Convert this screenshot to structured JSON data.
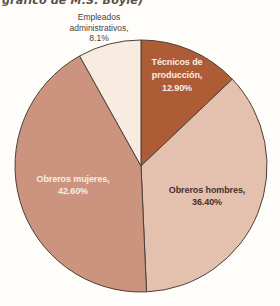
{
  "page": {
    "background": "#fefdfa",
    "caption_fragment": "gráfico de M.S. Boyle)",
    "caption_color": "#57504a"
  },
  "chart_data": {
    "type": "pie",
    "title": "",
    "legend": "none",
    "direction": "clockwise",
    "start_angle_deg": 0,
    "center": {
      "x": 141,
      "y": 166
    },
    "radius": 126,
    "outline_color": "#4a413c",
    "slices": [
      {
        "id": "tecnicos-de-produccion",
        "label": "Técnicos de producción",
        "value": 12.9,
        "display": "Técnicos de producción, 12.90%",
        "lines": [
          "Técnicos de",
          "producción,",
          "12.90%"
        ],
        "color": "#ae5c36",
        "text_color": "#f8eee3",
        "label_inside": true
      },
      {
        "id": "obreros-hombres",
        "label": "Obreros hombres",
        "value": 36.4,
        "display": "Obreros hombres, 36.40%",
        "lines": [
          "Obreros hombres,",
          "36.40%"
        ],
        "color": "#e4c0ae",
        "text_color": "#45322a",
        "label_inside": true
      },
      {
        "id": "obreros-mujeres",
        "label": "Obreros mujeres",
        "value": 42.6,
        "display": "Obreros mujeres, 42.60%",
        "lines": [
          "Obreros mujeres,",
          "42.60%"
        ],
        "color": "#cc937e",
        "text_color": "#f8eee3",
        "label_inside": true
      },
      {
        "id": "empleados-administrativos",
        "label": "Empleados administrativos",
        "value": 8.1,
        "display": "Empleados administrativos, 8.1%",
        "lines": [
          "Empleados",
          "administrativos,",
          "8.1%"
        ],
        "color": "#f8ece1",
        "text_color": "#4a423a",
        "label_inside": false
      }
    ]
  }
}
